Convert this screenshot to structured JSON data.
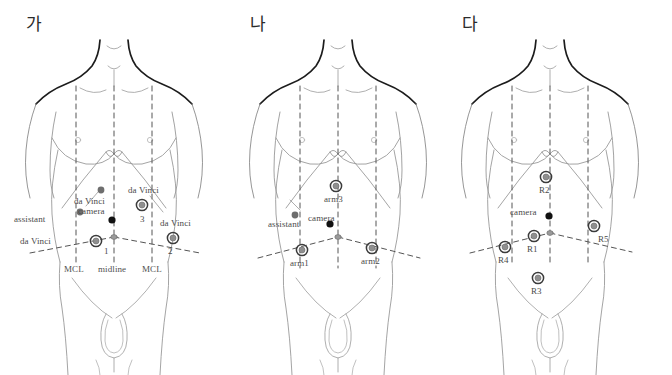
{
  "figure": {
    "title_absent": true,
    "background_color": "#ffffff",
    "panels": [
      {
        "id": "panel-a",
        "label": "가",
        "caption_absent": true,
        "ports": [
          {
            "name": "da-vinci-3",
            "kind": "trocar-large",
            "label_lines": [
              "da Vinci",
              "3"
            ],
            "label_top": "da Vinci",
            "label_bottom": "3",
            "x": 142,
            "y": 205
          },
          {
            "name": "da-vinci-1",
            "kind": "trocar-large",
            "label_lines": [
              "da Vinci",
              "1"
            ],
            "label_left": "da Vinci",
            "label_right": "1",
            "x": 96,
            "y": 241
          },
          {
            "name": "da-vinci-2",
            "kind": "trocar-large",
            "label_lines": [
              "da Vinci",
              "2"
            ],
            "label_top": "da Vinci",
            "label_bottom": "2",
            "x": 173,
            "y": 238
          },
          {
            "name": "assistant-upper",
            "kind": "dot-gray",
            "label": "",
            "x": 101,
            "y": 190
          },
          {
            "name": "assistant-lower",
            "kind": "dot-gray",
            "label": "assistant",
            "x": 80,
            "y": 212
          },
          {
            "name": "camera",
            "kind": "dot-black",
            "label": "camera",
            "x": 112,
            "y": 220
          }
        ],
        "inline_labels": [
          {
            "name": "label-da-vinci-camera",
            "text": "da Vinci"
          },
          {
            "name": "label-camera",
            "text": "camera"
          },
          {
            "name": "label-assistant",
            "text": "assistant"
          }
        ],
        "axis_labels": [
          {
            "name": "axis-mcl-left",
            "text": "MCL"
          },
          {
            "name": "axis-midline",
            "text": "midline"
          },
          {
            "name": "axis-mcl-right",
            "text": "MCL"
          }
        ]
      },
      {
        "id": "panel-b",
        "label": "나",
        "ports": [
          {
            "name": "arm3",
            "kind": "trocar-large",
            "label": "arm3",
            "x": 112,
            "y": 186
          },
          {
            "name": "arm1",
            "kind": "trocar-large",
            "label": "arm1",
            "x": 78,
            "y": 250
          },
          {
            "name": "arm2",
            "kind": "trocar-large",
            "label": "arm2",
            "x": 148,
            "y": 248
          },
          {
            "name": "assistant",
            "kind": "dot-gray",
            "label": "assistant",
            "x": 71,
            "y": 215
          },
          {
            "name": "camera",
            "kind": "dot-black",
            "label": "camera",
            "x": 106,
            "y": 224
          }
        ],
        "axis_labels": []
      },
      {
        "id": "panel-c",
        "label": "다",
        "ports": [
          {
            "name": "R2",
            "kind": "trocar-large",
            "label": "R2",
            "x": 98,
            "y": 177
          },
          {
            "name": "R1",
            "kind": "trocar-large",
            "label": "R1",
            "x": 86,
            "y": 236
          },
          {
            "name": "R4",
            "kind": "trocar-large",
            "label": "R4",
            "x": 57,
            "y": 247
          },
          {
            "name": "R5",
            "kind": "trocar-large",
            "label": "R5",
            "x": 146,
            "y": 226
          },
          {
            "name": "R3",
            "kind": "trocar-large",
            "label": "R3",
            "x": 90,
            "y": 278
          },
          {
            "name": "camera",
            "kind": "dot-black",
            "label": "camera",
            "x": 101,
            "y": 216
          }
        ],
        "axis_labels": []
      }
    ],
    "legend_terms": {
      "da_vinci": "da Vinci",
      "camera": "camera",
      "assistant": "assistant",
      "mcl": "MCL",
      "midline": "midline"
    },
    "colors": {
      "outline_light": "#8a8a8a",
      "outline_dark": "#1c1c1c",
      "dashed_line": "#555555",
      "port_ring": "#3b3b3b",
      "port_core": "#8f8f8f",
      "dot_gray": "#6e6e6e",
      "dot_black": "#111111",
      "text": "#4a4a4a"
    }
  }
}
